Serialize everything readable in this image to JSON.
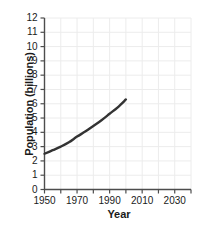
{
  "chart_data": {
    "type": "line",
    "title": "",
    "xlabel": "Year",
    "ylabel": "Population (billions)",
    "xlim": [
      1950,
      2040
    ],
    "ylim": [
      0,
      12
    ],
    "grid": true,
    "legend": null,
    "line_color": "#333333",
    "grid_color": "#ececec",
    "axis_color": "#4d4d4d",
    "background": "#ffffff",
    "xticks": [
      1950,
      1960,
      1970,
      1980,
      1990,
      2000,
      2010,
      2020,
      2030,
      2040
    ],
    "xtick_labels": [
      "1950",
      "",
      "1970",
      "",
      "1990",
      "",
      "2010",
      "",
      "2030",
      ""
    ],
    "yticks": [
      0,
      1,
      2,
      3,
      4,
      5,
      6,
      7,
      8,
      9,
      10,
      11,
      12
    ],
    "ytick_labels": [
      "0",
      "1",
      "2",
      "3",
      "4",
      "5",
      "6",
      "7",
      "8",
      "9",
      "10",
      "11",
      "12"
    ],
    "series": [
      {
        "name": "World population",
        "x": [
          1950,
          1955,
          1960,
          1965,
          1970,
          1975,
          1980,
          1985,
          1990,
          1995,
          2000
        ],
        "y": [
          2.5,
          2.75,
          3.0,
          3.3,
          3.7,
          4.05,
          4.45,
          4.85,
          5.3,
          5.75,
          6.3
        ]
      }
    ]
  },
  "axis_titles": {
    "x": "Year",
    "y": "Population (billions)"
  }
}
